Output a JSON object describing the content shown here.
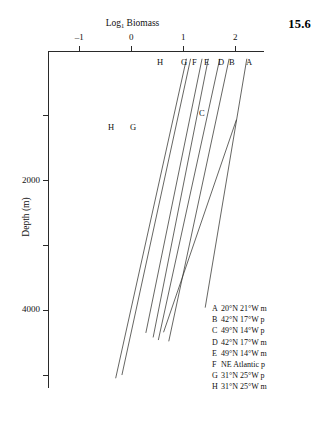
{
  "figure": {
    "number": "15.6"
  },
  "chart_data": {
    "type": "line",
    "title": "",
    "xlabel": "Log",
    "xlabel_sub": "1",
    "xlabel_rest": " Biomass",
    "xlabel_full": "Log₁ Biomass",
    "ylabel": "Depth (m)",
    "xlim": [
      -1.6,
      2.55
    ],
    "ylim": [
      0,
      5200
    ],
    "y_inverted": true,
    "grid": false,
    "legend_position": "bottom-right",
    "x_ticks": [
      {
        "value": -1,
        "label": "–1"
      },
      {
        "value": 0,
        "label": "0"
      },
      {
        "value": 1,
        "label": "1"
      },
      {
        "value": 2,
        "label": "2"
      }
    ],
    "y_ticks": [
      {
        "value": 1000,
        "label": ""
      },
      {
        "value": 2000,
        "label": "2000"
      },
      {
        "value": 3000,
        "label": ""
      },
      {
        "value": 4000,
        "label": "4000"
      },
      {
        "value": 5000,
        "label": ""
      }
    ],
    "series": [
      {
        "name": "A",
        "label": "A",
        "top_label_x": 2.28,
        "points": [
          [
            2.22,
            120
          ],
          [
            1.42,
            3960
          ]
        ]
      },
      {
        "name": "B",
        "label": "B",
        "top_label_x": 1.93,
        "points": [
          [
            1.88,
            120
          ],
          [
            0.72,
            4480
          ]
        ]
      },
      {
        "name": "C",
        "label": "C",
        "top_label_x": 1.8,
        "points": [
          [
            2.02,
            1060
          ],
          [
            0.62,
            4340
          ]
        ]
      },
      {
        "name": "D",
        "label": "D",
        "top_label_x": 1.75,
        "points": [
          [
            1.7,
            120
          ],
          [
            0.52,
            4460
          ]
        ]
      },
      {
        "name": "E",
        "label": "E",
        "top_label_x": 1.55,
        "points": [
          [
            1.48,
            120
          ],
          [
            0.42,
            4420
          ]
        ]
      },
      {
        "name": "F",
        "label": "F",
        "top_label_x": 1.4,
        "points": [
          [
            1.36,
            120
          ],
          [
            0.28,
            4350
          ]
        ]
      },
      {
        "name": "G",
        "label": "G",
        "top_label_x": 1.22,
        "inline_label": "G",
        "points": [
          [
            1.14,
            120
          ],
          [
            -0.18,
            5000
          ]
        ]
      },
      {
        "name": "H",
        "label": "H",
        "top_label_x": 0.98,
        "inline_label": "H",
        "points": [
          [
            1.06,
            120
          ],
          [
            -0.3,
            5050
          ]
        ]
      }
    ],
    "inline_annotations": [
      {
        "text": "H",
        "x_px": 108,
        "y_px": 122
      },
      {
        "text": "G",
        "x_px": 130,
        "y_px": 122
      },
      {
        "text": "C",
        "x_px": 199,
        "y_px": 108
      }
    ],
    "top_labels": [
      {
        "text": "H",
        "x_px": 157,
        "y_px": 57
      },
      {
        "text": "G",
        "x_px": 181,
        "y_px": 57
      },
      {
        "text": "F",
        "x_px": 192,
        "y_px": 57
      },
      {
        "text": "E",
        "x_px": 204,
        "y_px": 57
      },
      {
        "text": "D",
        "x_px": 218,
        "y_px": 57
      },
      {
        "text": "B",
        "x_px": 229,
        "y_px": 57
      },
      {
        "text": "A",
        "x_px": 246,
        "y_px": 57
      }
    ],
    "legend": [
      {
        "key": "A",
        "text": "20°N 21°W m"
      },
      {
        "key": "B",
        "text": "42°N 17°W p"
      },
      {
        "key": "C",
        "text": "49°N 14°W p"
      },
      {
        "key": "D",
        "text": "42°N 17°W m"
      },
      {
        "key": "E",
        "text": "49°N 14°W m"
      },
      {
        "key": "F",
        "text": "NE Atlantic p"
      },
      {
        "key": "G",
        "text": "31°N 25°W p"
      },
      {
        "key": "H",
        "text": "31°N 25°W m"
      }
    ],
    "colors": {
      "axis": "#2a2a2a",
      "line": "#33332f",
      "text": "#111111",
      "background": "#ffffff"
    }
  }
}
